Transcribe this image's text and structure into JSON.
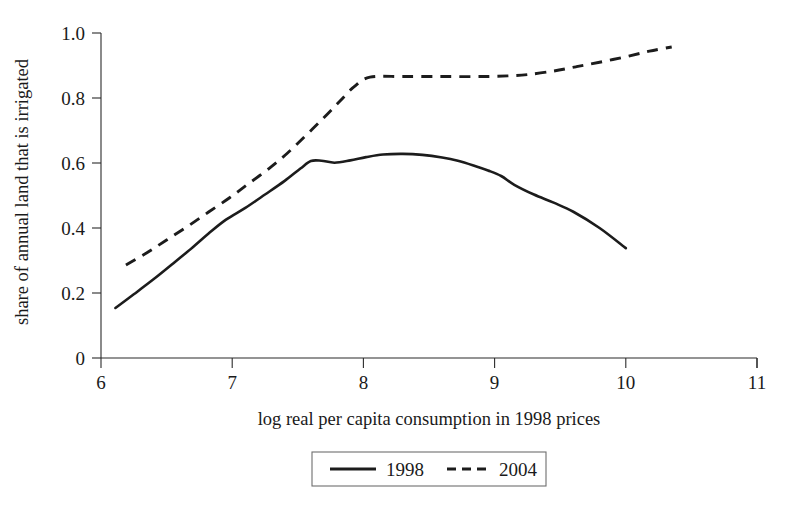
{
  "figure": {
    "background_color": "#ffffff",
    "line_color": "#1c1c1c",
    "axis_color": "#2b2b2b"
  },
  "axes": {
    "x_label": "log real per capita consumption in 1998 prices",
    "y_label": "share of annual land that is irrigated",
    "x_ticks": [
      "6",
      "7",
      "8",
      "9",
      "10",
      "11"
    ],
    "y_ticks": [
      "0",
      "0.2",
      "0.4",
      "0.6",
      "0.8",
      "1.0"
    ]
  },
  "legend": {
    "items": [
      {
        "label": "1998",
        "style": "solid"
      },
      {
        "label": "2004",
        "style": "dashed"
      }
    ]
  },
  "chart_data": {
    "type": "line",
    "title": "",
    "xlabel": "log real per capita consumption in 1998 prices",
    "ylabel": "share of annual land that is irrigated",
    "xlim": [
      6,
      11
    ],
    "ylim": [
      0,
      1.0
    ],
    "xticks": [
      6,
      7,
      8,
      9,
      10,
      11
    ],
    "yticks": [
      0,
      0.2,
      0.4,
      0.6,
      0.8,
      1.0
    ],
    "grid": false,
    "legend_position": "bottom-center",
    "series": [
      {
        "name": "1998",
        "style": "solid",
        "x": [
          6.11,
          6.25,
          6.4,
          6.55,
          6.7,
          6.82,
          6.95,
          7.1,
          7.25,
          7.4,
          7.52,
          7.6,
          7.68,
          7.78,
          7.9,
          8.02,
          8.15,
          8.3,
          8.45,
          8.6,
          8.72,
          8.85,
          8.95,
          9.05,
          9.15,
          9.3,
          9.45,
          9.6,
          9.8,
          10.0
        ],
        "y": [
          0.154,
          0.196,
          0.242,
          0.291,
          0.341,
          0.383,
          0.425,
          0.462,
          0.503,
          0.545,
          0.583,
          0.606,
          0.607,
          0.601,
          0.608,
          0.618,
          0.626,
          0.628,
          0.625,
          0.617,
          0.607,
          0.591,
          0.577,
          0.56,
          0.533,
          0.503,
          0.478,
          0.45,
          0.4,
          0.338
        ]
      },
      {
        "name": "2004",
        "style": "dashed",
        "x": [
          6.19,
          6.35,
          6.5,
          6.66,
          6.82,
          6.98,
          7.12,
          7.28,
          7.42,
          7.56,
          7.7,
          7.82,
          7.93,
          8.05,
          8.3,
          8.6,
          8.9,
          9.1,
          9.25,
          9.45,
          9.62,
          9.8,
          10.0,
          10.18,
          10.35
        ],
        "y": [
          0.286,
          0.324,
          0.363,
          0.405,
          0.449,
          0.493,
          0.535,
          0.583,
          0.63,
          0.684,
          0.74,
          0.79,
          0.835,
          0.864,
          0.866,
          0.866,
          0.866,
          0.868,
          0.872,
          0.883,
          0.896,
          0.91,
          0.927,
          0.944,
          0.957
        ]
      }
    ]
  }
}
